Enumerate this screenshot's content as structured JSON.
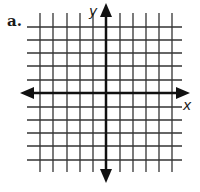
{
  "problem": {
    "label": "a."
  },
  "graph": {
    "type": "coordinate-grid",
    "x_axis_label": "x",
    "y_axis_label": "y",
    "grid_min": -5,
    "grid_max": 5,
    "colors": {
      "grid": "#333333",
      "axis": "#111111",
      "background": "#ffffff"
    }
  }
}
